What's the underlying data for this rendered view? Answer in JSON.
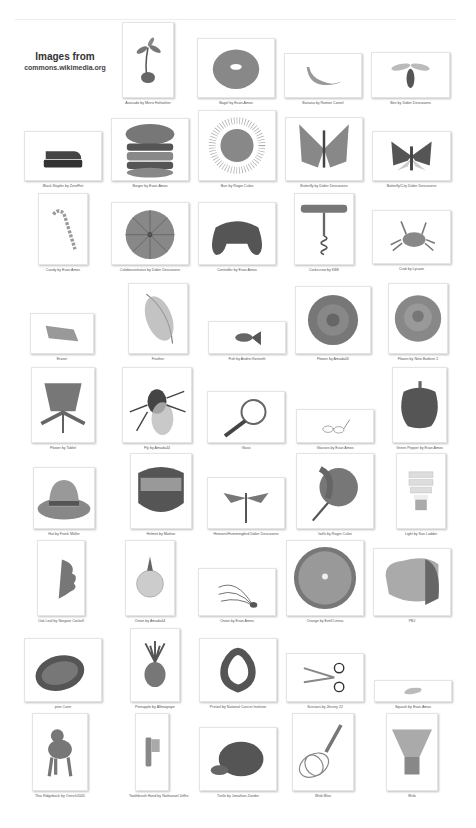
{
  "header": {
    "title": "Images from",
    "source": "commons.wikimedia.org"
  },
  "items": [
    {
      "name": "avocado",
      "caption": "Avocado by Mervi Hohtahter",
      "x": 122,
      "y": 22,
      "w": 52,
      "h": 84,
      "fh": 76
    },
    {
      "name": "bagel",
      "caption": "Bagel by Evan-Amos",
      "x": 197,
      "y": 38,
      "w": 78,
      "h": 68,
      "fh": 60
    },
    {
      "name": "banana",
      "caption": "Banana by Ramon Cornel",
      "x": 284,
      "y": 53,
      "w": 78,
      "h": 53,
      "fh": 45
    },
    {
      "name": "bee",
      "caption": "Bee by Didier Descouens",
      "x": 371,
      "y": 52,
      "w": 79,
      "h": 54,
      "fh": 46
    },
    {
      "name": "stapler",
      "caption": "Black Stapler by ZeroFlet",
      "x": 24,
      "y": 131,
      "w": 78,
      "h": 58,
      "fh": 50
    },
    {
      "name": "burger",
      "caption": "Burger by Evan-Amos",
      "x": 111,
      "y": 118,
      "w": 78,
      "h": 71,
      "fh": 63
    },
    {
      "name": "burr",
      "caption": "Burr by Roger Culos",
      "x": 198,
      "y": 110,
      "w": 78,
      "h": 79,
      "fh": 71
    },
    {
      "name": "butterfly",
      "caption": "Butterfly by Didier Descouens",
      "x": 285,
      "y": 117,
      "w": 78,
      "h": 72,
      "fh": 64
    },
    {
      "name": "butterfly-city",
      "caption": "Butterfly/City Didier Descouens",
      "x": 372,
      "y": 131,
      "w": 79,
      "h": 58,
      "fh": 50
    },
    {
      "name": "candy",
      "caption": "Candy by Evan Amos",
      "x": 38,
      "y": 193,
      "w": 50,
      "h": 80,
      "fh": 72
    },
    {
      "name": "sea-urchin",
      "caption": "Colobocentrotus by Didier Descouens",
      "x": 111,
      "y": 202,
      "w": 78,
      "h": 71,
      "fh": 63
    },
    {
      "name": "controller",
      "caption": "Controller by Evan Amos",
      "x": 198,
      "y": 202,
      "w": 78,
      "h": 71,
      "fh": 63
    },
    {
      "name": "corkscrew",
      "caption": "Corkscrew by KBS",
      "x": 294,
      "y": 193,
      "w": 60,
      "h": 80,
      "fh": 72
    },
    {
      "name": "crab",
      "caption": "Crab by Lycaon",
      "x": 372,
      "y": 210,
      "w": 79,
      "h": 62,
      "fh": 54
    },
    {
      "name": "eraser",
      "caption": "Eraser",
      "x": 30,
      "y": 313,
      "w": 64,
      "h": 49,
      "fh": 41
    },
    {
      "name": "feather",
      "caption": "Feather",
      "x": 128,
      "y": 283,
      "w": 60,
      "h": 79,
      "fh": 71
    },
    {
      "name": "fish",
      "caption": "Fish by Andrei Kenneth",
      "x": 208,
      "y": 321,
      "w": 78,
      "h": 41,
      "fh": 33
    },
    {
      "name": "flower",
      "caption": "Flower by Amada44",
      "x": 295,
      "y": 286,
      "w": 76,
      "h": 76,
      "fh": 68
    },
    {
      "name": "rose",
      "caption": "Flower by Nino Barbieri 2",
      "x": 388,
      "y": 283,
      "w": 60,
      "h": 79,
      "fh": 71
    },
    {
      "name": "thistle",
      "caption": "Flower by Tablet",
      "x": 31,
      "y": 367,
      "w": 64,
      "h": 84,
      "fh": 76
    },
    {
      "name": "fly",
      "caption": "Fly by Amada44",
      "x": 122,
      "y": 367,
      "w": 70,
      "h": 84,
      "fh": 76
    },
    {
      "name": "magnifier",
      "caption": "Glass",
      "x": 207,
      "y": 391,
      "w": 78,
      "h": 60,
      "fh": 52
    },
    {
      "name": "glasses",
      "caption": "Glasses by Evan Amos",
      "x": 296,
      "y": 409,
      "w": 78,
      "h": 42,
      "fh": 34
    },
    {
      "name": "pepper",
      "caption": "Green Pepper by Evan Amos",
      "x": 392,
      "y": 367,
      "w": 55,
      "h": 84,
      "fh": 76
    },
    {
      "name": "hat",
      "caption": "Hat by Frank Müller",
      "x": 33,
      "y": 467,
      "w": 62,
      "h": 70,
      "fh": 62
    },
    {
      "name": "helmet",
      "caption": "Helmet by Mattise",
      "x": 130,
      "y": 453,
      "w": 62,
      "h": 84,
      "fh": 76
    },
    {
      "name": "hummingbird-moth",
      "caption": "Hemaris/Hummingbird Didier Descouens",
      "x": 207,
      "y": 477,
      "w": 78,
      "h": 60,
      "fh": 52
    },
    {
      "name": "iris",
      "caption": "Iwills by Roger Culos",
      "x": 296,
      "y": 453,
      "w": 78,
      "h": 84,
      "fh": 76
    },
    {
      "name": "light",
      "caption": "Light by Sun Ladder",
      "x": 396,
      "y": 453,
      "w": 50,
      "h": 84,
      "fh": 76
    },
    {
      "name": "oak-leaf",
      "caption": "Oak Leaf by Norgate Cockell",
      "x": 37,
      "y": 540,
      "w": 48,
      "h": 84,
      "fh": 76
    },
    {
      "name": "onion",
      "caption": "Onion by Amada44",
      "x": 125,
      "y": 540,
      "w": 50,
      "h": 84,
      "fh": 76
    },
    {
      "name": "chives",
      "caption": "Onion by Evan Amos",
      "x": 198,
      "y": 568,
      "w": 78,
      "h": 56,
      "fh": 48
    },
    {
      "name": "orange",
      "caption": "Orange by Ezell Lenna",
      "x": 286,
      "y": 540,
      "w": 78,
      "h": 84,
      "fh": 76
    },
    {
      "name": "pbj",
      "caption": "PBJ",
      "x": 373,
      "y": 548,
      "w": 78,
      "h": 76,
      "fh": 68
    },
    {
      "name": "pine-cone",
      "caption": "pine Cone",
      "x": 24,
      "y": 638,
      "w": 78,
      "h": 72,
      "fh": 64
    },
    {
      "name": "pineapple",
      "caption": "Pineapple by Allmogrape",
      "x": 130,
      "y": 628,
      "w": 50,
      "h": 82,
      "fh": 74
    },
    {
      "name": "pretzel",
      "caption": "Pretzel by National Cancer Institute",
      "x": 199,
      "y": 638,
      "w": 78,
      "h": 72,
      "fh": 64
    },
    {
      "name": "scissors",
      "caption": "Scissors by Jlevrey 22",
      "x": 286,
      "y": 653,
      "w": 78,
      "h": 57,
      "fh": 49
    },
    {
      "name": "squash",
      "caption": "Squash by Evan Amos",
      "x": 374,
      "y": 680,
      "w": 78,
      "h": 30,
      "fh": 22
    },
    {
      "name": "dog",
      "caption": "Thai Ridgeback by Ostrich2005",
      "x": 32,
      "y": 713,
      "w": 56,
      "h": 86,
      "fh": 78
    },
    {
      "name": "toothbrush",
      "caption": "Toothbrush Hand by Nathanael Jeffre",
      "x": 135,
      "y": 713,
      "w": 34,
      "h": 86,
      "fh": 78
    },
    {
      "name": "turtle",
      "caption": "Turtle by Jonathan Zander",
      "x": 199,
      "y": 727,
      "w": 78,
      "h": 72,
      "fh": 64
    },
    {
      "name": "whisk",
      "caption": "Wisk Blue",
      "x": 292,
      "y": 713,
      "w": 62,
      "h": 86,
      "fh": 78
    },
    {
      "name": "matcha-whisk",
      "caption": "Wisk",
      "x": 386,
      "y": 713,
      "w": 52,
      "h": 86,
      "fh": 78
    }
  ],
  "colors": {
    "background": "#ffffff",
    "frame_border": "#e4e4e4",
    "caption": "#555555",
    "heading": "#333333"
  }
}
